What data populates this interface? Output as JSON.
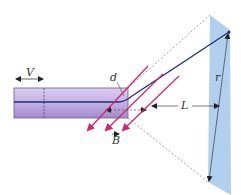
{
  "diagram": {
    "labels": {
      "voltage": "V",
      "gap": "d",
      "field": "B",
      "distance": "L",
      "radius": "r"
    },
    "colors": {
      "tube_fill_top": "#d9c8ef",
      "tube_fill_bottom": "#a592cc",
      "tube_stroke": "#6b5a8c",
      "beam": "#1e2f7a",
      "field_arrows": "#d6246e",
      "screen": "#a9cbee",
      "dashes": "#666666"
    },
    "field_arrow_count": 3
  }
}
